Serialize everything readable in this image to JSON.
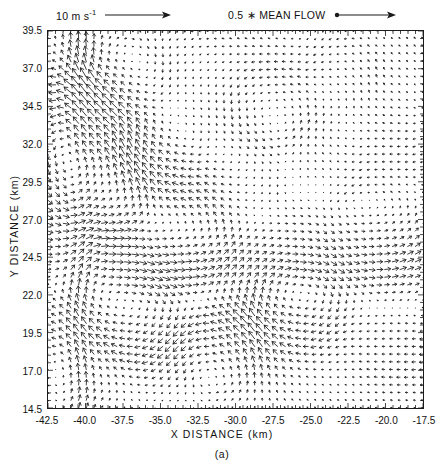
{
  "figure": {
    "panel_caption": "(a)",
    "background_color": "#ffffff",
    "foreground_color": "#111111"
  },
  "legend": {
    "scale_arrow": {
      "label_main": "10 m s",
      "label_exponent": "-1",
      "icon": "right-arrow-icon"
    },
    "mean_flow": {
      "label": "0.5 ∗ MEAN FLOW",
      "icon": "dot-tail-right-arrow-icon"
    }
  },
  "axes": {
    "x": {
      "label": "X DISTANCE (km)",
      "ticks": [
        "-42.5",
        "-40.0",
        "-37.5",
        "-35.0",
        "-32.5",
        "-30.0",
        "-27.5",
        "-25.0",
        "-22.5",
        "-20.0",
        "-17.5"
      ],
      "min": -42.5,
      "max": -17.5,
      "step": 2.5
    },
    "y": {
      "label": "Y DISTANCE (km)",
      "ticks": [
        "39.5",
        "37.0",
        "34.5",
        "32.0",
        "29.5",
        "27.0",
        "24.5",
        "22.0",
        "19.5",
        "17.0",
        "14.5"
      ],
      "min": 14.5,
      "max": 39.5,
      "step": 2.5
    }
  },
  "chart_data": {
    "type": "quiver",
    "title": "",
    "subtitle": "",
    "xlabel": "X DISTANCE (km)",
    "ylabel": "Y DISTANCE (km)",
    "xlim": [
      -42.5,
      -17.5
    ],
    "ylim": [
      14.5,
      39.5
    ],
    "grid": false,
    "legend_position": "above-axes",
    "annotations": [
      "10 m s-1",
      "0.5 ∗ MEAN FLOW",
      "(a)"
    ],
    "reference_vector_m_per_s": 10,
    "mean_flow_fraction_removed": 0.5,
    "grid_columns": 50,
    "grid_rows": 50,
    "grid_spacing_km": 0.5,
    "arrow_color": "#1a1a1a",
    "flow_features": [
      {
        "name": "strong-northerly-band",
        "x_center": -41.0,
        "y_center": 25.0,
        "note": "near-vertical long vectors along the western edge"
      },
      {
        "name": "vortex-couplet-upper-left",
        "x_center": -38.5,
        "y_center": 35.0,
        "note": "rotational shear zone"
      },
      {
        "name": "vortex-center-mid",
        "x_center": -33.0,
        "y_center": 29.0,
        "note": "weak-wind vortex core, very short vectors"
      },
      {
        "name": "convergence-line",
        "x_center": -28.0,
        "y_center": 22.2,
        "note": "strong horizontal shear line across the panel"
      },
      {
        "name": "easterly-return-flow",
        "x_center": -22.0,
        "y_center": 24.0,
        "note": "long horizontal vectors to the east"
      },
      {
        "name": "vortex-lower-center",
        "x_center": -30.0,
        "y_center": 17.5,
        "note": "cyclonic swirl near the bottom"
      },
      {
        "name": "quiet-corner-lower-right",
        "x_center": -19.0,
        "y_center": 16.0,
        "note": "sparse very short vectors"
      }
    ],
    "vector_field_model": {
      "note": "Field synthesized from a superposition of Rankine-type vortices plus a shear layer; parameters below reproduce the plotted pattern.",
      "vortices": [
        {
          "x": -40.6,
          "y": 33.2,
          "strength": 5.2,
          "radius": 3.0
        },
        {
          "x": -37.2,
          "y": 36.4,
          "strength": -4.2,
          "radius": 2.6
        },
        {
          "x": -38.8,
          "y": 28.6,
          "strength": 4.6,
          "radius": 2.8
        },
        {
          "x": -34.6,
          "y": 31.4,
          "strength": -3.4,
          "radius": 2.4
        },
        {
          "x": -33.2,
          "y": 25.2,
          "strength": 4.0,
          "radius": 2.9
        },
        {
          "x": -29.4,
          "y": 29.8,
          "strength": -3.0,
          "radius": 2.5
        },
        {
          "x": -27.6,
          "y": 34.6,
          "strength": 3.2,
          "radius": 2.7
        },
        {
          "x": -24.0,
          "y": 31.0,
          "strength": -2.6,
          "radius": 2.6
        },
        {
          "x": -21.0,
          "y": 26.0,
          "strength": 3.6,
          "radius": 3.1
        },
        {
          "x": -26.0,
          "y": 21.0,
          "strength": -4.0,
          "radius": 2.8
        },
        {
          "x": -31.0,
          "y": 18.2,
          "strength": 4.4,
          "radius": 2.7
        },
        {
          "x": -36.4,
          "y": 20.0,
          "strength": -3.2,
          "radius": 2.5
        },
        {
          "x": -40.0,
          "y": 17.0,
          "strength": 3.0,
          "radius": 2.4
        },
        {
          "x": -19.6,
          "y": 19.0,
          "strength": -2.2,
          "radius": 2.6
        },
        {
          "x": -22.8,
          "y": 36.8,
          "strength": 2.4,
          "radius": 2.3
        }
      ],
      "shear_layers": [
        {
          "y": 22.2,
          "du": 5.0,
          "halfwidth": 1.6
        },
        {
          "y": 29.6,
          "du": -2.4,
          "halfwidth": 2.0
        }
      ],
      "uniform_u": -0.6,
      "uniform_v": 0.4,
      "western_jet": {
        "x": -40.4,
        "halfwidth": 1.1,
        "dv": 6.0
      }
    }
  }
}
